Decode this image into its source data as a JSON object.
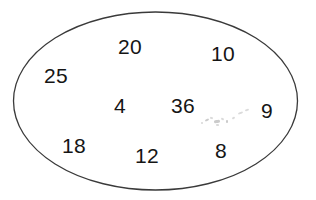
{
  "figure": {
    "type": "set-oval-diagram",
    "background_color": "#ffffff",
    "outline_color": "#3a3a3a",
    "text_color": "#151515"
  },
  "oval": {
    "name": "oval-boundary",
    "center_x": 155.5,
    "center_y": 101,
    "radius_x": 142,
    "radius_y": 89,
    "stroke_width": 1.3,
    "fill": "none"
  },
  "numbers": [
    {
      "value": "20",
      "x": 118,
      "y": 36,
      "font_size": 21
    },
    {
      "value": "10",
      "x": 211,
      "y": 43,
      "font_size": 21
    },
    {
      "value": "25",
      "x": 44,
      "y": 65,
      "font_size": 21
    },
    {
      "value": "4",
      "x": 114,
      "y": 95,
      "font_size": 21
    },
    {
      "value": "36",
      "x": 171,
      "y": 95,
      "font_size": 21
    },
    {
      "value": "9",
      "x": 261,
      "y": 100,
      "font_size": 21
    },
    {
      "value": "18",
      "x": 62,
      "y": 135,
      "font_size": 21
    },
    {
      "value": "12",
      "x": 135,
      "y": 145,
      "font_size": 21
    },
    {
      "value": "8",
      "x": 215,
      "y": 140,
      "font_size": 21
    }
  ],
  "artifacts": {
    "name": "scan-smudge",
    "description": "faint grey scanning specks below and right of 36",
    "specks": [
      {
        "x": 205,
        "y": 119,
        "w": 4,
        "h": 2,
        "rot": -25,
        "faint": false
      },
      {
        "x": 210,
        "y": 117,
        "w": 3,
        "h": 2,
        "rot": 15,
        "faint": true
      },
      {
        "x": 214,
        "y": 120,
        "w": 6,
        "h": 3,
        "rot": -8,
        "faint": false
      },
      {
        "x": 221,
        "y": 118,
        "w": 3,
        "h": 2,
        "rot": 30,
        "faint": true
      },
      {
        "x": 226,
        "y": 120,
        "w": 2,
        "h": 3,
        "rot": 0,
        "faint": false
      },
      {
        "x": 232,
        "y": 117,
        "w": 3,
        "h": 2,
        "rot": -35,
        "faint": true
      },
      {
        "x": 238,
        "y": 112,
        "w": 5,
        "h": 2,
        "rot": -20,
        "faint": true
      },
      {
        "x": 245,
        "y": 109,
        "w": 4,
        "h": 2,
        "rot": -18,
        "faint": true
      },
      {
        "x": 216,
        "y": 124,
        "w": 3,
        "h": 2,
        "rot": 10,
        "faint": true
      },
      {
        "x": 201,
        "y": 122,
        "w": 2,
        "h": 2,
        "rot": 0,
        "faint": true
      }
    ]
  },
  "chart_data": {
    "type": "scatter",
    "xlabel": "",
    "ylabel": "",
    "values": [
      20,
      10,
      25,
      4,
      36,
      9,
      18,
      12,
      8
    ],
    "labels": [
      "20",
      "10",
      "25",
      "4",
      "36",
      "9",
      "18",
      "12",
      "8"
    ],
    "points": [
      {
        "label": "20",
        "value": 20,
        "x": 135,
        "y": 48
      },
      {
        "label": "10",
        "value": 10,
        "x": 227,
        "y": 55
      },
      {
        "label": "25",
        "value": 25,
        "x": 60,
        "y": 77
      },
      {
        "label": "4",
        "value": 4,
        "x": 122,
        "y": 107
      },
      {
        "label": "36",
        "value": 36,
        "x": 188,
        "y": 107
      },
      {
        "label": "9",
        "value": 9,
        "x": 269,
        "y": 112
      },
      {
        "label": "18",
        "value": 18,
        "x": 79,
        "y": 147
      },
      {
        "label": "12",
        "value": 12,
        "x": 152,
        "y": 157
      },
      {
        "label": "8",
        "value": 8,
        "x": 224,
        "y": 152
      }
    ],
    "grid": false,
    "legend": "none",
    "annotations": [
      "Closed oval outline enclosing all nine numbers"
    ]
  }
}
